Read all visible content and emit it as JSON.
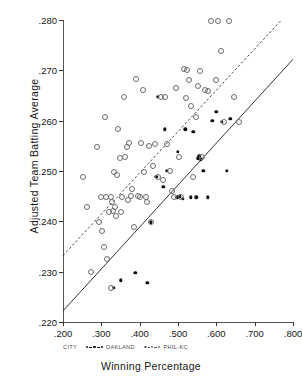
{
  "chart_data": {
    "type": "scatter",
    "title": "",
    "xlabel": "Winning Percentage",
    "ylabel": "Adjusted Team Batting Average",
    "xlim": [
      0.2,
      0.8
    ],
    "ylim": [
      0.22,
      0.28
    ],
    "xticks": [
      ".200",
      ".300",
      ".400",
      ".500",
      ".600",
      ".700",
      ".800"
    ],
    "xtick_values": [
      0.2,
      0.3,
      0.4,
      0.5,
      0.6,
      0.7,
      0.8
    ],
    "yticks": [
      ".220",
      ".230",
      ".240",
      ".250",
      ".260",
      ".270",
      ".280"
    ],
    "ytick_values": [
      0.22,
      0.23,
      0.24,
      0.25,
      0.26,
      0.27,
      0.28
    ],
    "grid": false,
    "legend_position": "below-axis",
    "legend_title": "CITY",
    "series": [
      {
        "name": "OAKLAND",
        "marker": "filled-circle",
        "line_style": "solid",
        "points": [
          [
            0.332,
            0.2268
          ],
          [
            0.35,
            0.2283
          ],
          [
            0.389,
            0.2298
          ],
          [
            0.42,
            0.2278
          ],
          [
            0.429,
            0.2398
          ],
          [
            0.443,
            0.2488
          ],
          [
            0.447,
            0.2648
          ],
          [
            0.462,
            0.2468
          ],
          [
            0.466,
            0.2583
          ],
          [
            0.47,
            0.25
          ],
          [
            0.498,
            0.2448
          ],
          [
            0.5,
            0.2538
          ],
          [
            0.505,
            0.245
          ],
          [
            0.512,
            0.2445
          ],
          [
            0.519,
            0.2583
          ],
          [
            0.533,
            0.2448
          ],
          [
            0.54,
            0.2578
          ],
          [
            0.548,
            0.2448
          ],
          [
            0.551,
            0.2525
          ],
          [
            0.556,
            0.253
          ],
          [
            0.56,
            0.2523
          ],
          [
            0.566,
            0.25
          ],
          [
            0.578,
            0.2448
          ],
          [
            0.589,
            0.26
          ],
          [
            0.6,
            0.2618
          ],
          [
            0.614,
            0.2598
          ],
          [
            0.627,
            0.25
          ],
          [
            0.636,
            0.2604
          ]
        ]
      },
      {
        "name": "PHIL-KC",
        "marker": "open-circle",
        "line_style": "dashed",
        "points": [
          [
            0.253,
            0.2488
          ],
          [
            0.263,
            0.2428
          ],
          [
            0.272,
            0.23
          ],
          [
            0.289,
            0.2548
          ],
          [
            0.295,
            0.2398
          ],
          [
            0.3,
            0.2448
          ],
          [
            0.303,
            0.238
          ],
          [
            0.308,
            0.235
          ],
          [
            0.31,
            0.2608
          ],
          [
            0.312,
            0.2448
          ],
          [
            0.316,
            0.2325
          ],
          [
            0.32,
            0.2418
          ],
          [
            0.324,
            0.2448
          ],
          [
            0.325,
            0.2268
          ],
          [
            0.329,
            0.2438
          ],
          [
            0.331,
            0.242
          ],
          [
            0.333,
            0.2498
          ],
          [
            0.336,
            0.2428
          ],
          [
            0.338,
            0.241
          ],
          [
            0.34,
            0.2493
          ],
          [
            0.344,
            0.2583
          ],
          [
            0.348,
            0.2525
          ],
          [
            0.352,
            0.2418
          ],
          [
            0.355,
            0.2448
          ],
          [
            0.36,
            0.2648
          ],
          [
            0.362,
            0.2528
          ],
          [
            0.366,
            0.2548
          ],
          [
            0.37,
            0.2443
          ],
          [
            0.373,
            0.2555
          ],
          [
            0.377,
            0.245
          ],
          [
            0.381,
            0.2465
          ],
          [
            0.385,
            0.2388
          ],
          [
            0.39,
            0.2683
          ],
          [
            0.395,
            0.245
          ],
          [
            0.4,
            0.2448
          ],
          [
            0.403,
            0.2555
          ],
          [
            0.408,
            0.266
          ],
          [
            0.412,
            0.2498
          ],
          [
            0.417,
            0.2448
          ],
          [
            0.42,
            0.2438
          ],
          [
            0.424,
            0.255
          ],
          [
            0.43,
            0.2398
          ],
          [
            0.435,
            0.251
          ],
          [
            0.44,
            0.2553
          ],
          [
            0.447,
            0.2488
          ],
          [
            0.455,
            0.2648
          ],
          [
            0.46,
            0.2483
          ],
          [
            0.466,
            0.2648
          ],
          [
            0.47,
            0.2553
          ],
          [
            0.478,
            0.25
          ],
          [
            0.485,
            0.246
          ],
          [
            0.49,
            0.2448
          ],
          [
            0.496,
            0.2665
          ],
          [
            0.503,
            0.2528
          ],
          [
            0.508,
            0.2448
          ],
          [
            0.515,
            0.2703
          ],
          [
            0.52,
            0.2645
          ],
          [
            0.524,
            0.27
          ],
          [
            0.528,
            0.268
          ],
          [
            0.533,
            0.263
          ],
          [
            0.54,
            0.2488
          ],
          [
            0.546,
            0.2608
          ],
          [
            0.552,
            0.2668
          ],
          [
            0.558,
            0.2698
          ],
          [
            0.563,
            0.2528
          ],
          [
            0.57,
            0.266
          ],
          [
            0.577,
            0.2658
          ],
          [
            0.585,
            0.2798
          ],
          [
            0.6,
            0.268
          ],
          [
            0.605,
            0.2798
          ],
          [
            0.613,
            0.2738
          ],
          [
            0.62,
            0.2598
          ],
          [
            0.632,
            0.2798
          ],
          [
            0.645,
            0.2648
          ],
          [
            0.66,
            0.2598
          ]
        ]
      }
    ],
    "fit_lines": [
      {
        "series": "OAKLAND",
        "style": "solid",
        "x0": 0.2,
        "y0": 0.2222,
        "x1": 0.8,
        "y1": 0.2722
      },
      {
        "series": "PHIL-KC",
        "style": "dashed",
        "x0": 0.2,
        "y0": 0.2332,
        "x1": 0.77,
        "y1": 0.28
      }
    ]
  }
}
